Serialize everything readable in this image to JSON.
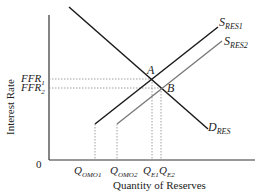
{
  "diagram": {
    "type": "supply-demand",
    "axes": {
      "y_label": "Interest Rate",
      "x_label": "Quantity of Reserves",
      "origin_label": "0"
    },
    "curves": {
      "demand": {
        "label": "D",
        "sub": "RES"
      },
      "supply1": {
        "label": "S",
        "sub": "RES1"
      },
      "supply2": {
        "label": "S",
        "sub": "RES2"
      }
    },
    "points": {
      "a": "A",
      "b": "B"
    },
    "y_ticks": [
      {
        "label": "FFR",
        "sub": "1"
      },
      {
        "label": "FFR",
        "sub": "2"
      }
    ],
    "x_ticks": [
      {
        "label": "Q",
        "sub": "OMO1"
      },
      {
        "label": "Q",
        "sub": "OMO2"
      },
      {
        "label": "Q",
        "sub": "E1"
      },
      {
        "label": "Q",
        "sub": "E2"
      }
    ],
    "colors": {
      "axis": "#333333",
      "demand": "#1a1a1a",
      "supply1": "#1a1a1a",
      "supply2": "#777777",
      "guide": "#888888"
    }
  }
}
